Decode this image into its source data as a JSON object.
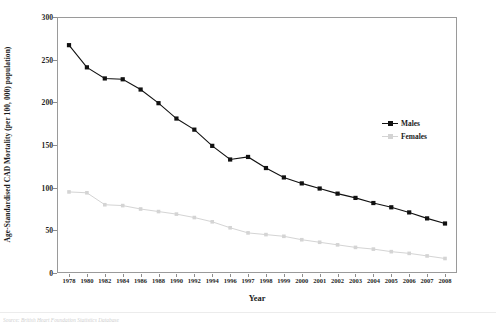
{
  "chart_data": {
    "type": "line",
    "title": "",
    "subtitle": "",
    "xlabel": "Year",
    "ylabel": "Age-Standardised CAD Mortality (per 100, 000) population)",
    "categories": [
      "1978",
      "1980",
      "1982",
      "1984",
      "1986",
      "1988",
      "1990",
      "1992",
      "1994",
      "1996",
      "1997",
      "1998",
      "1999",
      "2000",
      "2001",
      "2002",
      "2003",
      "2004",
      "2005",
      "2006",
      "2007",
      "2008"
    ],
    "x_tick_labels": [
      "1978",
      "1980",
      "1982",
      "1984",
      "1986",
      "1988",
      "1990",
      "1992",
      "1994",
      "1996",
      "1997",
      "1998",
      "1999",
      "2000",
      "2001",
      "2002",
      "2003",
      "2004",
      "2005",
      "2006",
      "2007",
      "2008"
    ],
    "y_tick_labels": [
      "0",
      "50",
      "100",
      "150",
      "200",
      "250",
      "300"
    ],
    "y_ticks": [
      0,
      50,
      100,
      150,
      200,
      250,
      300
    ],
    "ylim": [
      0,
      300
    ],
    "grid": false,
    "legend_position": "right-middle",
    "series": [
      {
        "name": "Males",
        "color": "#111111",
        "marker": "square-filled",
        "values": [
          267,
          241,
          228,
          227,
          215,
          199,
          181,
          168,
          149,
          133,
          136,
          123,
          112,
          105,
          99,
          93,
          88,
          82,
          77,
          71,
          64,
          58
        ]
      },
      {
        "name": "Females",
        "color": "#d4d4d4",
        "marker": "square-filled",
        "values": [
          95,
          94,
          80,
          79,
          75,
          72,
          69,
          65,
          60,
          53,
          47,
          45,
          43,
          39,
          36,
          33,
          30,
          28,
          25,
          23,
          20,
          17
        ]
      }
    ]
  },
  "legend": {
    "items": [
      {
        "label": "Males",
        "color": "#111111"
      },
      {
        "label": "Females",
        "color": "#d4d4d4"
      }
    ]
  },
  "axes": {
    "y_title": "Age-Standardised CAD Mortality (per 100, 000) population)",
    "x_title": "Year"
  },
  "footer": {
    "caption": "Source: British Heart Foundation Statistics Database"
  }
}
